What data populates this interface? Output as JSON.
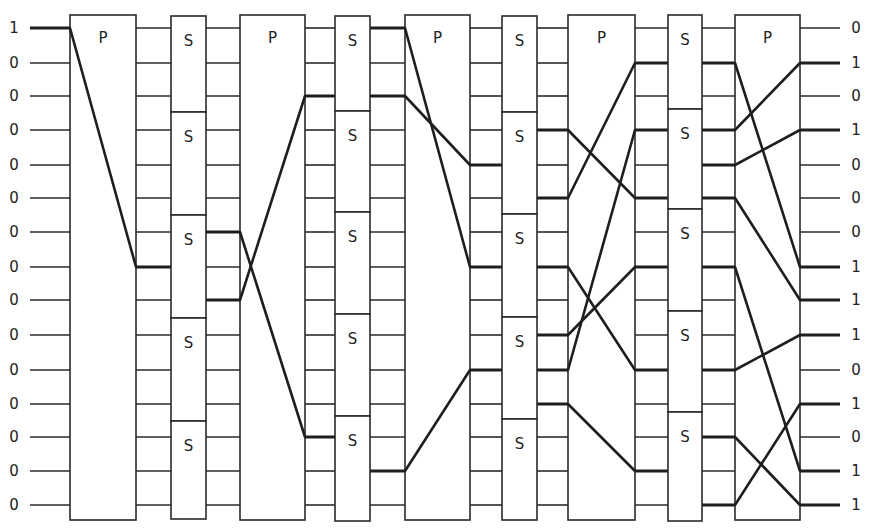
{
  "colors": {
    "line": "#2a2a2a",
    "active_line": "#1e1e1e",
    "background": "#ffffff"
  },
  "rows_y": [
    28,
    63,
    96,
    130,
    165,
    198,
    232,
    267,
    300,
    335,
    370,
    404,
    437,
    471,
    505
  ],
  "inputs": [
    "1",
    "0",
    "0",
    "0",
    "0",
    "0",
    "0",
    "0",
    "0",
    "0",
    "0",
    "0",
    "0",
    "0",
    "0"
  ],
  "outputs": [
    "0",
    "1",
    "0",
    "1",
    "0",
    "0",
    "0",
    "1",
    "1",
    "1",
    "0",
    "1",
    "0",
    "1",
    "1"
  ],
  "stages": [
    {
      "type": "P",
      "label": "P",
      "x0": 70,
      "x1": 136,
      "map": [
        [
          0,
          7
        ]
      ]
    },
    {
      "type": "S",
      "label": "S",
      "x0": 171,
      "x1": 206,
      "blocks": [
        16,
        112,
        215,
        318,
        421,
        519
      ],
      "on_in": [
        7
      ],
      "on_out": [
        6,
        8
      ]
    },
    {
      "type": "P",
      "label": "P",
      "x0": 240,
      "x1": 305,
      "map": [
        [
          6,
          12
        ],
        [
          8,
          2
        ]
      ]
    },
    {
      "type": "S",
      "label": "S",
      "x0": 335,
      "x1": 370,
      "blocks": [
        16,
        111,
        212,
        314,
        416,
        521
      ],
      "on_in": [
        2,
        12
      ],
      "on_out": [
        0,
        2,
        13
      ]
    },
    {
      "type": "P",
      "label": "P",
      "x0": 405,
      "x1": 470,
      "map": [
        [
          0,
          7
        ],
        [
          2,
          4
        ],
        [
          13,
          10
        ]
      ]
    },
    {
      "type": "S",
      "label": "S",
      "x0": 502,
      "x1": 537,
      "blocks": [
        16,
        112,
        214,
        317,
        419,
        520
      ],
      "on_in": [
        4,
        7,
        10
      ],
      "on_out": [
        3,
        5,
        7,
        9,
        10,
        11
      ]
    },
    {
      "type": "P",
      "label": "P",
      "x0": 568,
      "x1": 635,
      "map": [
        [
          3,
          5
        ],
        [
          5,
          1
        ],
        [
          7,
          10
        ],
        [
          9,
          7
        ],
        [
          10,
          3
        ],
        [
          11,
          13
        ]
      ]
    },
    {
      "type": "S",
      "label": "S",
      "x0": 668,
      "x1": 702,
      "blocks": [
        15,
        109,
        209,
        311,
        412,
        521
      ],
      "on_in": [
        1,
        3,
        5,
        7,
        10,
        13
      ],
      "on_out": [
        1,
        3,
        4,
        5,
        7,
        10,
        12,
        14
      ]
    },
    {
      "type": "P",
      "label": "P",
      "x0": 735,
      "x1": 800,
      "map": [
        [
          1,
          7
        ],
        [
          3,
          1
        ],
        [
          4,
          3
        ],
        [
          5,
          8
        ],
        [
          7,
          13
        ],
        [
          10,
          9
        ],
        [
          12,
          14
        ],
        [
          14,
          11
        ]
      ]
    }
  ],
  "p_top": 15,
  "p_bottom": 520,
  "input_x": [
    30,
    70
  ],
  "output_x": [
    800,
    840
  ]
}
